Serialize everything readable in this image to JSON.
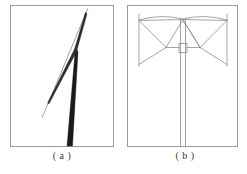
{
  "figure": {
    "background_color": "#ffffff",
    "panel_border_color": "#9a9a9a",
    "line_color_thin": "#8d8d8d",
    "line_color_dark": "#7e7e7e",
    "mast_color": "#1a1a1a",
    "caption_color": "#3a3a3a",
    "panels": [
      {
        "id": "a",
        "caption": "( a )",
        "frame": {
          "x": 10,
          "y": 5,
          "width": 103,
          "height": 141
        },
        "description": "tapering dark mast with two thin diagonal reference lines",
        "mast": {
          "apex_x": 75,
          "apex_y": 48,
          "base_left_x": 67,
          "base_right_x": 72,
          "base_y": 146,
          "color": "#1a1a1a"
        },
        "thin_lines": [
          {
            "x1": 88,
            "y1": 8,
            "x2": 42,
            "y2": 118,
            "color": "#8d8d8d"
          },
          {
            "x1": 86,
            "y1": 14,
            "x2": 70,
            "y2": 60,
            "color": "#555555"
          }
        ]
      },
      {
        "id": "b",
        "caption": "( b )",
        "frame": {
          "x": 127,
          "y": 5,
          "width": 111,
          "height": 141
        },
        "description": "guyed mast tower with symmetric guy wires and two vertical anchor posts",
        "mast": {
          "left_x": 180,
          "right_x": 186,
          "top_y": 19,
          "base_y": 146,
          "color": "#8d8d8d"
        },
        "apex": {
          "x": 183,
          "y": 19
        },
        "collar": {
          "x": 179,
          "y": 44,
          "width": 8,
          "height": 9
        },
        "anchor_posts": [
          {
            "x": 139,
            "y_top": 14,
            "y_bottom": 65
          },
          {
            "x": 227,
            "y_top": 14,
            "y_bottom": 65
          }
        ],
        "guy_wires": [
          {
            "x1": 183,
            "y1": 19,
            "x2": 139,
            "y2": 20
          },
          {
            "x1": 183,
            "y1": 19,
            "x2": 227,
            "y2": 20
          },
          {
            "x1": 183,
            "y1": 19,
            "x2": 166,
            "y2": 48
          },
          {
            "x1": 183,
            "y1": 19,
            "x2": 200,
            "y2": 48
          },
          {
            "x1": 139,
            "y1": 20,
            "x2": 166,
            "y2": 48
          },
          {
            "x1": 227,
            "y1": 20,
            "x2": 200,
            "y2": 48
          },
          {
            "x1": 166,
            "y1": 48,
            "x2": 139,
            "y2": 64
          },
          {
            "x1": 200,
            "y1": 48,
            "x2": 227,
            "y2": 64
          },
          {
            "x1": 166,
            "y1": 48,
            "x2": 179,
            "y2": 48
          },
          {
            "x1": 187,
            "y1": 48,
            "x2": 200,
            "y2": 48
          }
        ],
        "canopy_arcs": [
          {
            "from_x": 139,
            "from_y": 20,
            "ctrl_x": 161,
            "ctrl_y": 14,
            "to_x": 183,
            "to_y": 19
          },
          {
            "from_x": 183,
            "from_y": 19,
            "ctrl_x": 205,
            "ctrl_y": 14,
            "to_x": 227,
            "to_y": 20
          },
          {
            "from_x": 183,
            "from_y": 22,
            "ctrl_x": 192,
            "ctrl_y": 36,
            "to_x": 200,
            "to_y": 48
          }
        ]
      }
    ]
  }
}
